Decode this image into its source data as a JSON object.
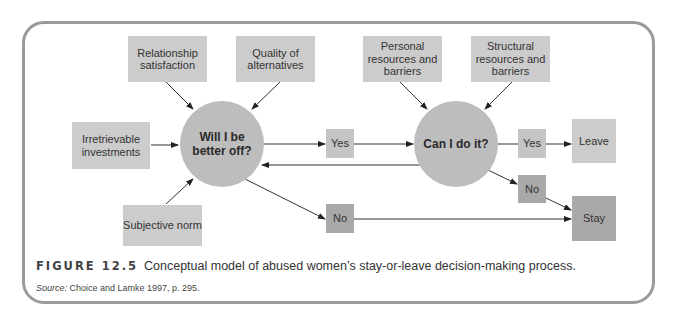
{
  "figure": {
    "label": "FIGURE 12.5",
    "caption": "Conceptual model of abused women’s stay-or-leave decision-making process.",
    "source_label": "Source:",
    "source_text": " Choice and Lamke 1997, p. 295."
  },
  "nodes": {
    "relationship_satisfaction": "Relationship satisfaction",
    "quality_of_alternatives": "Quality of alternatives",
    "irretrievable_investments": "Irretrievable investments",
    "subjective_norm": "Subjective norm",
    "will_i_be_better_off": "Will I be better off?",
    "personal_resources": "Personal resources and barriers",
    "structural_resources": "Structural resources and barriers",
    "can_i_do_it": "Can I do it?",
    "yes_1": "Yes",
    "no_1": "No",
    "yes_2": "Yes",
    "no_2": "No",
    "leave": "Leave",
    "stay": "Stay"
  },
  "colors": {
    "frame": "#9a9a9a",
    "factor_box": "#cccccc",
    "decision_circle": "#bdbdbd",
    "no_box": "#a9a9a9",
    "stay_box": "#a9a9a9",
    "arrow": "#333333"
  }
}
